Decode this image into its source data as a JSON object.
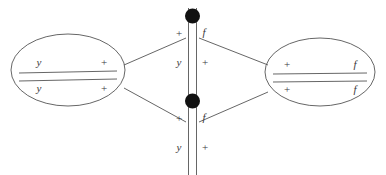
{
  "diagram": {
    "type": "node-link-diagram",
    "background_color": "#ffffff",
    "stroke_color": "#555555",
    "node_fill_color": "#111111",
    "text_color": "#3a3a3a",
    "left_group": {
      "name": "left-ellipse",
      "rows": [
        {
          "left_label": "y",
          "right_label": "+"
        },
        {
          "left_label": "y",
          "right_label": "+"
        }
      ]
    },
    "right_group": {
      "name": "right-ellipse",
      "rows": [
        {
          "left_label": "+",
          "right_label": "f"
        },
        {
          "left_label": "+",
          "right_label": "f"
        }
      ]
    },
    "center_column": {
      "name": "center-channel",
      "nodes": [
        {
          "id": "top-node",
          "upper_left_label": "+",
          "upper_right_label": "f",
          "lower_left_label": "y",
          "lower_right_label": "+"
        },
        {
          "id": "bottom-node",
          "upper_left_label": "+",
          "upper_right_label": "f",
          "lower_left_label": "y",
          "lower_right_label": "+"
        }
      ]
    }
  }
}
